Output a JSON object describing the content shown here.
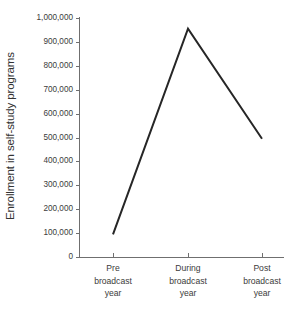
{
  "chart_data": {
    "type": "line",
    "title": "",
    "xlabel": "",
    "ylabel": "Enrollment in self-study programs",
    "categories": [
      "Pre broadcast year",
      "During broadcast year",
      "Post broadcast year"
    ],
    "category_lines": [
      [
        "Pre",
        "broadcast",
        "year"
      ],
      [
        "During",
        "broadcast",
        "year"
      ],
      [
        "Post",
        "broadcast",
        "year"
      ]
    ],
    "values": [
      95000,
      955000,
      495000
    ],
    "ylim": [
      0,
      1000000
    ],
    "ytick_values": [
      0,
      100000,
      200000,
      300000,
      400000,
      500000,
      600000,
      700000,
      800000,
      900000,
      1000000
    ],
    "ytick_labels": [
      "0",
      "100,000",
      "200,000",
      "300,000",
      "400,000",
      "500,000",
      "600,000",
      "700,000",
      "800,000",
      "900,000",
      "1,000,000"
    ],
    "grid": false,
    "legend": false,
    "legend_position": "none",
    "markers": false,
    "series": [
      {
        "name": "Enrollment in self-study programs",
        "values": [
          95000,
          955000,
          495000
        ]
      }
    ],
    "colors": {
      "background": "#ffffff",
      "line": "#262626",
      "axis": "#6f6f6f",
      "text": "#3b3b3b"
    }
  }
}
